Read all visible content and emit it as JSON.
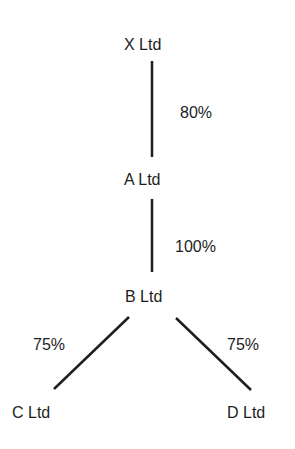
{
  "diagram": {
    "type": "ownership-tree",
    "nodes": [
      {
        "id": "x",
        "label": "X Ltd"
      },
      {
        "id": "a",
        "label": "A Ltd"
      },
      {
        "id": "b",
        "label": "B Ltd"
      },
      {
        "id": "c",
        "label": "C Ltd"
      },
      {
        "id": "d",
        "label": "D Ltd"
      }
    ],
    "edges": [
      {
        "from": "x",
        "to": "a",
        "label": "80%"
      },
      {
        "from": "a",
        "to": "b",
        "label": "100%"
      },
      {
        "from": "b",
        "to": "c",
        "label": "75%"
      },
      {
        "from": "b",
        "to": "d",
        "label": "75%"
      }
    ],
    "line_color": "#1e1e1e"
  }
}
